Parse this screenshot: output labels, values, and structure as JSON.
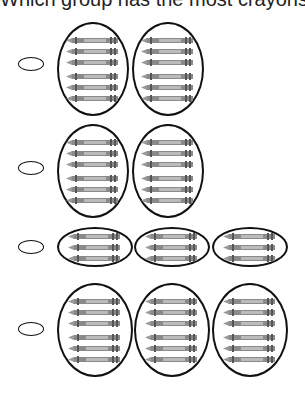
{
  "title": "Which group has the most crayons?",
  "rows": [
    {
      "groups": 2,
      "crayons_per_group": 6
    },
    {
      "groups": 2,
      "crayons_per_group": 6
    },
    {
      "groups": 3,
      "crayons_per_group": 3
    },
    {
      "groups": 3,
      "crayons_per_group": 6
    }
  ],
  "icons": {
    "answer": "empty-oval-bubble",
    "item": "crayon-icon"
  },
  "colors": {
    "outline": "#111111",
    "crayon": "#8a8a8a"
  }
}
